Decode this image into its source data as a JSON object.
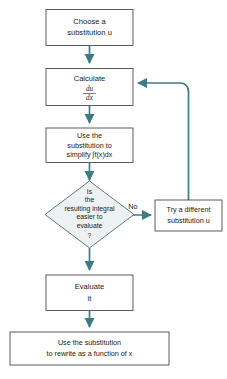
{
  "diagram": {
    "colors": {
      "connector": "#3d7b85",
      "box_stroke": "#4b4b4b",
      "box_fill": "#ffffff",
      "diamond_fill": "#eef1f2",
      "diamond_stroke": "#4b6f74",
      "text": "#1b1b1b",
      "background": "#ffffff"
    },
    "nodes": [
      {
        "id": "choose-substitution",
        "shape": "rect",
        "lines": [
          "Choose a",
          "substitution u"
        ]
      },
      {
        "id": "calculate-derivative",
        "shape": "rect",
        "lines": [
          "Calculate"
        ],
        "fraction": {
          "numerator": "du",
          "denominator": "dx"
        }
      },
      {
        "id": "use-substitution-simplify",
        "shape": "rect",
        "lines": [
          "Use the",
          "substitution to",
          "simplify ∫f(x)dx"
        ]
      },
      {
        "id": "decision-easier",
        "shape": "diamond",
        "lines": [
          "Is",
          "the",
          "resulting integral",
          "easier to",
          "evaluate",
          "?"
        ]
      },
      {
        "id": "try-different-substitution",
        "shape": "rect",
        "lines": [
          "Try a different",
          "substitution u"
        ]
      },
      {
        "id": "evaluate-it",
        "shape": "rect",
        "lines": [
          "Evaluate",
          "it"
        ]
      },
      {
        "id": "rewrite-function-of-x",
        "shape": "rect",
        "lines": [
          "Use the substitution",
          "to rewrite as a function of x"
        ]
      }
    ],
    "edge_labels": {
      "no_branch": "No"
    }
  }
}
